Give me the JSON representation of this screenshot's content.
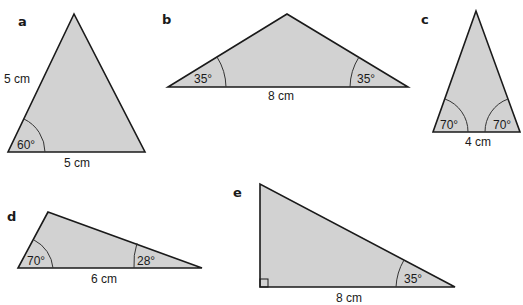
{
  "colors": {
    "fill": "#d2d2d2",
    "stroke": "#1a1a1a",
    "background": "#ffffff"
  },
  "triangles": [
    {
      "id": "a",
      "letter": "a",
      "side_labels": [
        "5 cm",
        "5 cm"
      ],
      "angle_labels": [
        "60°"
      ]
    },
    {
      "id": "b",
      "letter": "b",
      "side_labels": [
        "8 cm"
      ],
      "angle_labels": [
        "35°",
        "35°"
      ]
    },
    {
      "id": "c",
      "letter": "c",
      "side_labels": [
        "4 cm"
      ],
      "angle_labels": [
        "70°",
        "70°"
      ]
    },
    {
      "id": "d",
      "letter": "d",
      "side_labels": [
        "6 cm"
      ],
      "angle_labels": [
        "70°",
        "28°"
      ]
    },
    {
      "id": "e",
      "letter": "e",
      "side_labels": [
        "8 cm"
      ],
      "angle_labels": [
        "35°"
      ],
      "right_angle_marker": true
    }
  ]
}
